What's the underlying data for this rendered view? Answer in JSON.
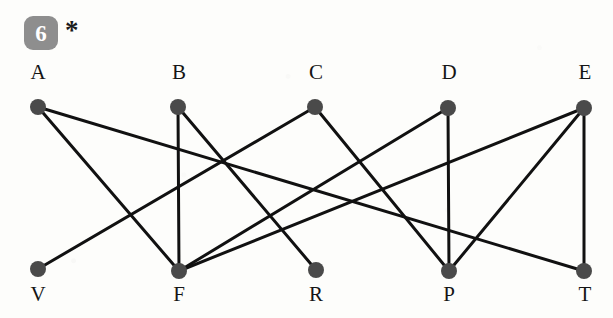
{
  "figure": {
    "problem_number": "6",
    "asterisk": "*",
    "badge_color": "#8e8e8e",
    "badge_text_color": "#ffffff",
    "node_color": "#4a4a4a",
    "edge_color": "#111111",
    "background_color": "#fdfdfb",
    "caption": ""
  },
  "chart_data": {
    "type": "diagram",
    "diagram_kind": "bipartite-graph",
    "title": "",
    "xlabel": "",
    "ylabel": "",
    "grid": false,
    "legend": "none",
    "node_radius": 8,
    "edge_width": 3,
    "nodes": [
      {
        "id": "A",
        "label": "A",
        "x": 38,
        "y": 107,
        "row": "top",
        "label_x": 38,
        "label_y": 78,
        "degree": 2
      },
      {
        "id": "B",
        "label": "B",
        "x": 178,
        "y": 107,
        "row": "top",
        "label_x": 179,
        "label_y": 78,
        "degree": 2
      },
      {
        "id": "C",
        "label": "C",
        "x": 315,
        "y": 107,
        "row": "top",
        "label_x": 316,
        "label_y": 78,
        "degree": 2
      },
      {
        "id": "D",
        "label": "D",
        "x": 448,
        "y": 108,
        "row": "top",
        "label_x": 449,
        "label_y": 78,
        "degree": 2
      },
      {
        "id": "E",
        "label": "E",
        "x": 584,
        "y": 108,
        "row": "top",
        "label_x": 585,
        "label_y": 78,
        "degree": 3
      },
      {
        "id": "V",
        "label": "V",
        "x": 38,
        "y": 269,
        "row": "bottom",
        "label_x": 38,
        "label_y": 300,
        "degree": 1
      },
      {
        "id": "F",
        "label": "F",
        "x": 179,
        "y": 271,
        "row": "bottom",
        "label_x": 179,
        "label_y": 300,
        "degree": 4
      },
      {
        "id": "R",
        "label": "R",
        "x": 316,
        "y": 270,
        "row": "bottom",
        "label_x": 316,
        "label_y": 300,
        "degree": 1
      },
      {
        "id": "P",
        "label": "P",
        "x": 449,
        "y": 271,
        "row": "bottom",
        "label_x": 449,
        "label_y": 300,
        "degree": 3
      },
      {
        "id": "T",
        "label": "T",
        "x": 584,
        "y": 271,
        "row": "bottom",
        "label_x": 585,
        "label_y": 300,
        "degree": 2
      }
    ],
    "edges": [
      {
        "from": "A",
        "to": "F"
      },
      {
        "from": "A",
        "to": "T"
      },
      {
        "from": "B",
        "to": "F"
      },
      {
        "from": "B",
        "to": "R"
      },
      {
        "from": "C",
        "to": "V"
      },
      {
        "from": "C",
        "to": "P"
      },
      {
        "from": "D",
        "to": "F"
      },
      {
        "from": "D",
        "to": "P"
      },
      {
        "from": "E",
        "to": "F"
      },
      {
        "from": "E",
        "to": "P"
      },
      {
        "from": "E",
        "to": "T"
      }
    ],
    "edge_count": 11,
    "node_count": 10,
    "top_row_labels": [
      "A",
      "B",
      "C",
      "D",
      "E"
    ],
    "bottom_row_labels": [
      "V",
      "F",
      "R",
      "P",
      "T"
    ]
  }
}
